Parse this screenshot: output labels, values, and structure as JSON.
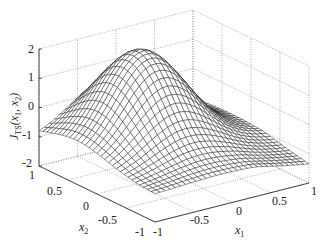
{
  "chart_data": {
    "type": "surface3d",
    "title": "",
    "xlabel": "x1",
    "ylabel": "x2",
    "zlabel": "J_TS(x1, x2)",
    "xlim": [
      -1,
      1
    ],
    "ylim": [
      -1,
      1
    ],
    "zlim": [
      -2,
      2
    ],
    "x_ticks": [
      "-1",
      "-0.5",
      "0",
      "0.5",
      "1"
    ],
    "y_ticks": [
      "-1",
      "-0.5",
      "0",
      "0.5",
      "1"
    ],
    "z_ticks": [
      "-2",
      "-1",
      "0",
      "1",
      "2"
    ],
    "grid": true,
    "grid_style": "dotted",
    "mesh_color": "#1a1a1a",
    "mesh_resolution": 31,
    "surface_model": {
      "description": "Single hump peaking near 2 around x1≈-0.2, x2≈0.4; edges near -1",
      "amplitude": 3.05,
      "offset": -1.05,
      "center_x1": -0.15,
      "center_x2": 0.35,
      "sigma2_x1": 0.42,
      "sigma2_x2": 0.55
    },
    "approx_values": {
      "peak": 2.0,
      "corner_x1_-1_x2_1": -1.0,
      "corner_x1_1_x2_-1": -1.2,
      "corner_x1_-1_x2_-1": -0.9,
      "corner_x1_1_x2_1": -0.8
    }
  },
  "labels": {
    "z_axis_label": "J",
    "z_axis_sub": "TS",
    "z_axis_args": "(x",
    "x1_label": "x",
    "x1_sub": "1",
    "x2_label": "x",
    "x2_sub": "2"
  },
  "caption": "Figure ... J_TS(x1, x2)"
}
